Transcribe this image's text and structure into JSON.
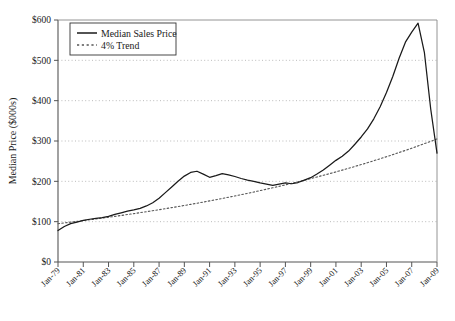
{
  "chart_data": {
    "type": "line",
    "title": "",
    "xlabel": "",
    "ylabel": "Median Price ($000s)",
    "ylim": [
      0,
      600
    ],
    "ytick_values": [
      0,
      100,
      200,
      300,
      400,
      500,
      600
    ],
    "ytick_labels": [
      "$0",
      "$100",
      "$200",
      "$300",
      "$400",
      "$500",
      "$600"
    ],
    "grid": "horizontal-dotted",
    "legend_position": "top-left",
    "xlim": [
      "Jan-79",
      "Jan-09"
    ],
    "xtick_labels": [
      "Jan-79",
      "Jan-81",
      "Jan-83",
      "Jan-85",
      "Jan-87",
      "Jan-89",
      "Jan-91",
      "Jan-93",
      "Jan-95",
      "Jan-97",
      "Jan-99",
      "Jan-01",
      "Jan-03",
      "Jan-05",
      "Jan-07",
      "Jan-09"
    ],
    "series": [
      {
        "name": "Median Sales Price",
        "style": "solid",
        "color": "#1a1a1a",
        "x": [
          "Jan-79",
          "Jul-79",
          "Jan-80",
          "Jul-80",
          "Jan-81",
          "Jul-81",
          "Jan-82",
          "Jul-82",
          "Jan-83",
          "Jul-83",
          "Jan-84",
          "Jul-84",
          "Jan-85",
          "Jul-85",
          "Jan-86",
          "Jul-86",
          "Jan-87",
          "Jul-87",
          "Jan-88",
          "Jul-88",
          "Jan-89",
          "Jul-89",
          "Jan-90",
          "Jul-90",
          "Jan-91",
          "Jul-91",
          "Jan-92",
          "Jul-92",
          "Jan-93",
          "Jul-93",
          "Jan-94",
          "Jul-94",
          "Jan-95",
          "Jul-95",
          "Jan-96",
          "Jul-96",
          "Jan-97",
          "Jul-97",
          "Jan-98",
          "Jul-98",
          "Jan-99",
          "Jul-99",
          "Jan-00",
          "Jul-00",
          "Jan-01",
          "Jul-01",
          "Jan-02",
          "Jul-02",
          "Jan-03",
          "Jul-03",
          "Jan-04",
          "Jul-04",
          "Jan-05",
          "Jul-05",
          "Jan-06",
          "Jul-06",
          "Jan-07",
          "Jul-07",
          "Jan-08",
          "Jul-08",
          "Jan-09"
        ],
        "values": [
          78,
          88,
          95,
          99,
          103,
          106,
          108,
          110,
          113,
          118,
          122,
          126,
          129,
          133,
          139,
          147,
          158,
          172,
          186,
          200,
          213,
          222,
          225,
          218,
          210,
          214,
          219,
          216,
          212,
          207,
          203,
          200,
          196,
          193,
          190,
          193,
          196,
          194,
          197,
          203,
          209,
          218,
          228,
          240,
          252,
          262,
          275,
          292,
          310,
          330,
          355,
          385,
          420,
          460,
          505,
          545,
          570,
          592,
          520,
          380,
          270
        ]
      },
      {
        "name": "4% Trend",
        "style": "dashed",
        "color": "#555555",
        "x": [
          "Jan-79",
          "Jan-09"
        ],
        "values": [
          95,
          305
        ],
        "annual_growth_pct": 4
      }
    ],
    "legend": [
      {
        "label": "Median Sales Price",
        "style": "solid"
      },
      {
        "label": "4% Trend",
        "style": "dashed"
      }
    ]
  }
}
